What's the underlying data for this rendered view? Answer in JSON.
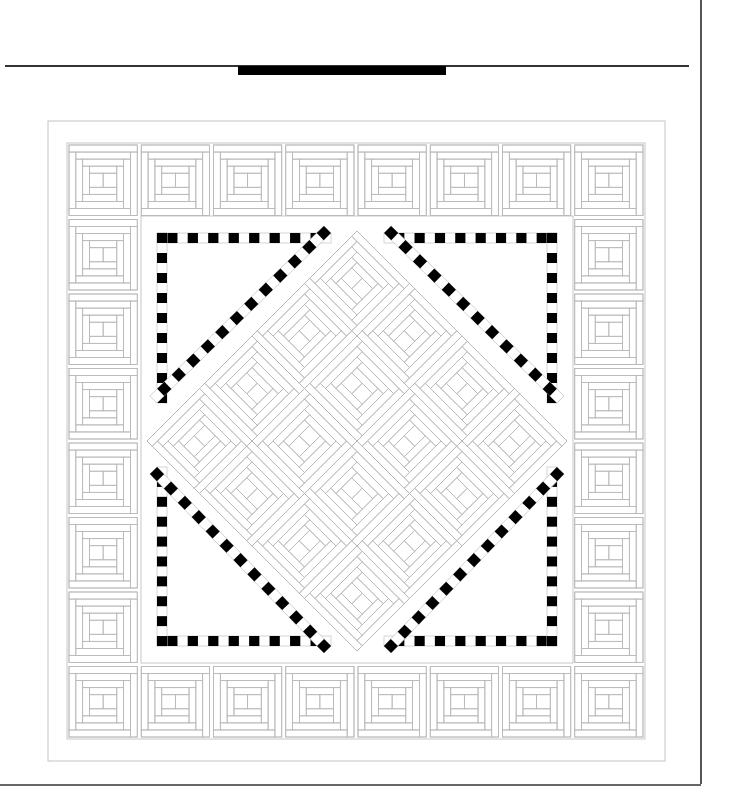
{
  "page": {
    "width": 732,
    "height": 811,
    "colors": {
      "line": "#b8b8b8",
      "frame": "#c4c4c4",
      "checker_dark": "#000000",
      "checker_light": "#ffffff",
      "rule": "#333333"
    }
  },
  "quilt": {
    "outer_frame": {
      "x": 48,
      "y": 121,
      "w": 617,
      "h": 640
    },
    "border_area": {
      "x": 67,
      "y": 143,
      "w": 578,
      "h": 596
    },
    "border_grid": {
      "cols": 8,
      "rows": 8
    },
    "inner_area": {
      "x": 141,
      "y": 216,
      "w": 432,
      "h": 447
    },
    "center_diamond": {
      "cx": 357,
      "cy": 441,
      "half_diagonal": 210,
      "grid": 4
    },
    "checker_triangles": [
      {
        "name": "top-left",
        "corner": [
          157,
          233
        ],
        "ends": [
          [
            331,
            233
          ],
          [
            157,
            403
          ]
        ]
      },
      {
        "name": "top-right",
        "corner": [
          557,
          233
        ],
        "ends": [
          [
            384,
            233
          ],
          [
            557,
            403
          ]
        ]
      },
      {
        "name": "bottom-left",
        "corner": [
          157,
          646
        ],
        "ends": [
          [
            331,
            646
          ],
          [
            157,
            467
          ]
        ]
      },
      {
        "name": "bottom-right",
        "corner": [
          557,
          646
        ],
        "ends": [
          [
            384,
            646
          ],
          [
            557,
            467
          ]
        ]
      }
    ],
    "checker_square_size": 10,
    "block_style": "log-cabin"
  }
}
